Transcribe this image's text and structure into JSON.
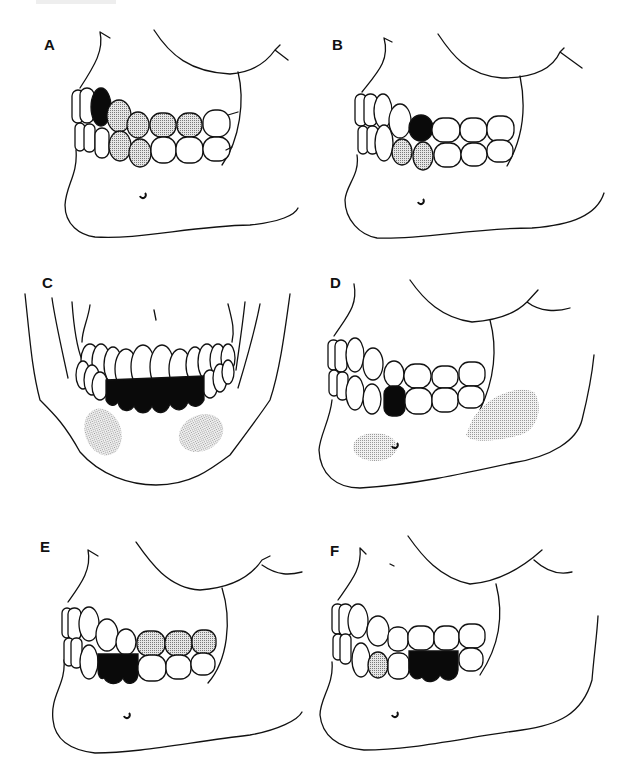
{
  "figure": {
    "panels": [
      {
        "id": "A",
        "label": "A",
        "view": "lateral",
        "black_teeth": [
          "upper canine"
        ],
        "dotted_teeth": [
          "upper premolars (2)",
          "upper molars (2)",
          "lower premolars (2)"
        ],
        "shaded_regions": []
      },
      {
        "id": "B",
        "label": "B",
        "view": "lateral",
        "black_teeth": [
          "upper first premolar"
        ],
        "dotted_teeth": [
          "lower canine",
          "lower first premolar"
        ],
        "shaded_regions": []
      },
      {
        "id": "C",
        "label": "C",
        "view": "frontal",
        "black_teeth": [
          "lower anterior teeth (canine to canine)"
        ],
        "dotted_teeth": [],
        "shaded_regions": [
          "left mental region",
          "right mental region"
        ]
      },
      {
        "id": "D",
        "label": "D",
        "view": "lateral",
        "black_teeth": [
          "lower premolar"
        ],
        "dotted_teeth": [],
        "shaded_regions": [
          "mental foramen region",
          "angle of mandible region"
        ]
      },
      {
        "id": "E",
        "label": "E",
        "view": "lateral",
        "black_teeth": [
          "lower premolars (2)"
        ],
        "dotted_teeth": [
          "upper molars (3)"
        ],
        "shaded_regions": []
      },
      {
        "id": "F",
        "label": "F",
        "view": "lateral",
        "black_teeth": [
          "lower molars (2)"
        ],
        "dotted_teeth": [
          "lower canine"
        ],
        "shaded_regions": []
      }
    ]
  },
  "colors": {
    "line": "#111111",
    "fill_black": "#0a0a0a",
    "stipple": "#9a9a9a",
    "background": "#ffffff"
  }
}
